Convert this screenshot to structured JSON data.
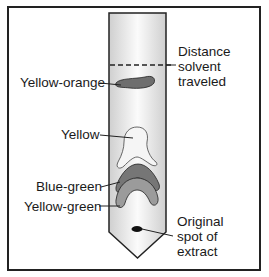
{
  "diagram": {
    "type": "paper chromatography strip",
    "labels": {
      "solvent_front": [
        "Distance",
        "solvent",
        "traveled"
      ],
      "yellow_orange": "Yellow-orange",
      "yellow": "Yellow",
      "blue_green": "Blue-green",
      "yellow_green": "Yellow-green",
      "origin": [
        "Original",
        "spot of",
        "extract"
      ]
    },
    "colors": {
      "strip_edge": "#d4d4d4",
      "strip_center": "#fafafa",
      "outline": "#222222",
      "yellow_orange_band": "#6e6e6e",
      "yellow_band": "#f4f4f4",
      "blue_green_band": "#777777",
      "yellow_green_band": "#9c9c9c",
      "origin_spot": "#111111"
    }
  }
}
